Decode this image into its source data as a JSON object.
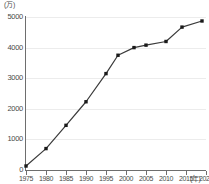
{
  "chart_data": {
    "type": "line",
    "title": "",
    "subtitle": "",
    "xlabel": "年",
    "ylabel": "万",
    "y_unit_label": "(万)",
    "x_unit_label": "(年)",
    "xlim": [
      1975,
      2020
    ],
    "ylim": [
      0,
      5000
    ],
    "ytick_values": [
      0,
      1000,
      2000,
      3000,
      4000,
      5000
    ],
    "ytick_labels": [
      "0",
      "1000",
      "2000",
      "3000",
      "4000",
      "5000"
    ],
    "xtick_values": [
      1975,
      1980,
      1985,
      1990,
      1995,
      2000,
      2005,
      2010,
      2015,
      2020
    ],
    "xtick_labels": [
      "1975",
      "1980",
      "1985",
      "1990",
      "1995",
      "2000",
      "2005",
      "2010",
      "2015",
      "2020"
    ],
    "grid": true,
    "grid_axis": "y",
    "legend": false,
    "legend_position": "none",
    "marker": "square",
    "line_color": "#3a3a3a",
    "marker_color": "#1a1a1a",
    "grid_color": "#ececec",
    "axis_color": "#6e6e6e",
    "x": [
      1975,
      1980,
      1985,
      1990,
      1995,
      1998,
      2002,
      2005,
      2010,
      2014,
      2019
    ],
    "values": [
      130,
      700,
      1460,
      2230,
      3150,
      3750,
      4000,
      4080,
      4200,
      4670,
      4870
    ],
    "series": [
      {
        "name": "",
        "points": [
          {
            "x": 1975,
            "y": 130
          },
          {
            "x": 1980,
            "y": 700
          },
          {
            "x": 1985,
            "y": 1460
          },
          {
            "x": 1990,
            "y": 2230
          },
          {
            "x": 1995,
            "y": 3150
          },
          {
            "x": 1998,
            "y": 3750
          },
          {
            "x": 2002,
            "y": 4000
          },
          {
            "x": 2005,
            "y": 4080
          },
          {
            "x": 2010,
            "y": 4200
          },
          {
            "x": 2014,
            "y": 4670
          },
          {
            "x": 2019,
            "y": 4870
          }
        ]
      }
    ],
    "annotations": []
  }
}
